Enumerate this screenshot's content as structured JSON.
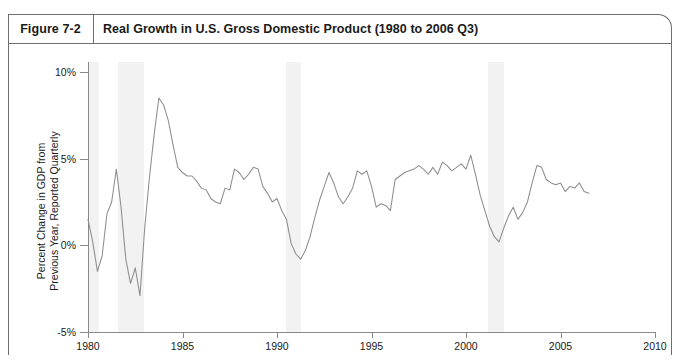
{
  "figure": {
    "label": "Figure 7-2",
    "title": "Real Growth in U.S. Gross Domestic Product (1980 to 2006 Q3)"
  },
  "colors": {
    "line": "#8d8d8d",
    "axis": "#8a8a8a",
    "frame": "#6f6f6f",
    "band": "#f2f2f2",
    "text": "#1a1a1a",
    "background": "#ffffff"
  },
  "chart_data": {
    "type": "line",
    "title": "Real Growth in U.S. Gross Domestic Product (1980 to 2006 Q3)",
    "xlabel": "",
    "ylabel": "Percent Change in GDP from Previous Year, Reported Quarterly",
    "ylabel_lines": [
      "Percent Change in GDP from",
      "Previous Year, Reported Quarterly"
    ],
    "xlim": [
      1980,
      2010
    ],
    "ylim": [
      -5,
      10
    ],
    "xticks": [
      1980,
      1985,
      1990,
      1995,
      2000,
      2005,
      2010
    ],
    "xticklabels": [
      "1980",
      "1985",
      "1990",
      "1995",
      "2000",
      "2005",
      "2010"
    ],
    "yticks": [
      -5,
      0,
      5,
      10
    ],
    "yticklabels": [
      "-5%",
      "0%",
      "5%",
      "10%"
    ],
    "grid": false,
    "legend": false,
    "legend_position": "none",
    "shaded_regions": [
      {
        "name": "recession-1980",
        "start": 1980.0,
        "end": 1980.6
      },
      {
        "name": "recession-1981-82",
        "start": 1981.6,
        "end": 2982.95
      },
      {
        "name": "recession-1990-91",
        "start": 1990.5,
        "end": 1991.25
      },
      {
        "name": "recession-2001",
        "start": 2001.15,
        "end": 2002.0
      }
    ],
    "series": [
      {
        "name": "Real GDP growth, percent change from previous year",
        "x": [
          1980.0,
          1980.25,
          1980.5,
          1980.75,
          1981.0,
          1981.25,
          1981.5,
          1981.75,
          1982.0,
          1982.25,
          1982.5,
          1982.75,
          1983.0,
          1983.25,
          1983.5,
          1983.75,
          1984.0,
          1984.25,
          1984.5,
          1984.75,
          1985.0,
          1985.25,
          1985.5,
          1985.75,
          1986.0,
          1986.25,
          1986.5,
          1986.75,
          1987.0,
          1987.25,
          1987.5,
          1987.75,
          1988.0,
          1988.25,
          1988.5,
          1988.75,
          1989.0,
          1989.25,
          1989.5,
          1989.75,
          1990.0,
          1990.25,
          1990.5,
          1990.75,
          1991.0,
          1991.25,
          1991.5,
          1991.75,
          1992.0,
          1992.25,
          1992.5,
          1992.75,
          1993.0,
          1993.25,
          1993.5,
          1993.75,
          1994.0,
          1994.25,
          1994.5,
          1994.75,
          1995.0,
          1995.25,
          1995.5,
          1995.75,
          1996.0,
          1996.25,
          1996.5,
          1996.75,
          1997.0,
          1997.25,
          1997.5,
          1997.75,
          1998.0,
          1998.25,
          1998.5,
          1998.75,
          1999.0,
          1999.25,
          1999.5,
          1999.75,
          2000.0,
          2000.25,
          2000.5,
          2000.75,
          2001.0,
          2001.25,
          2001.5,
          2001.75,
          2002.0,
          2002.25,
          2002.5,
          2002.75,
          2003.0,
          2003.25,
          2003.5,
          2003.75,
          2004.0,
          2004.25,
          2004.5,
          2004.75,
          2005.0,
          2005.25,
          2005.5,
          2005.75,
          2006.0,
          2006.25,
          2006.5
        ],
        "values": [
          1.5,
          0.2,
          -1.5,
          -0.6,
          1.8,
          2.5,
          4.4,
          2.2,
          -0.8,
          -2.2,
          -1.3,
          -2.9,
          1.0,
          3.9,
          6.4,
          8.5,
          8.1,
          7.2,
          5.8,
          4.5,
          4.2,
          4.0,
          4.0,
          3.7,
          3.3,
          3.2,
          2.7,
          2.5,
          2.4,
          3.3,
          3.2,
          4.4,
          4.2,
          3.8,
          4.1,
          4.5,
          4.4,
          3.4,
          3.0,
          2.5,
          2.7,
          2.0,
          1.5,
          0.1,
          -0.5,
          -0.8,
          -0.3,
          0.5,
          1.6,
          2.6,
          3.4,
          4.2,
          3.6,
          2.8,
          2.4,
          2.8,
          3.3,
          4.3,
          4.1,
          4.3,
          3.4,
          2.2,
          2.4,
          2.3,
          2.0,
          3.8,
          4.0,
          4.2,
          4.3,
          4.4,
          4.6,
          4.4,
          4.1,
          4.5,
          4.1,
          4.8,
          4.6,
          4.3,
          4.5,
          4.7,
          4.4,
          5.2,
          4.1,
          2.9,
          2.0,
          1.1,
          0.5,
          0.2,
          1.0,
          1.7,
          2.2,
          1.5,
          1.9,
          2.5,
          3.6,
          4.6,
          4.5,
          3.8,
          3.6,
          3.5,
          3.6,
          3.1,
          3.4,
          3.3,
          3.6,
          3.1,
          3.0
        ]
      }
    ]
  }
}
